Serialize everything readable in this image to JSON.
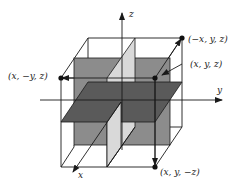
{
  "diagram": {
    "type": "3d-reflection-symmetry",
    "axes": {
      "x": "x",
      "y": "y",
      "z": "z"
    },
    "points": [
      {
        "id": "p-xyz",
        "label": "(x,  y,  z)"
      },
      {
        "id": "p-neg-x",
        "label": "(−x,  y,  z)"
      },
      {
        "id": "p-neg-y",
        "label": "(x,  −y,  z)"
      },
      {
        "id": "p-neg-z",
        "label": "(x,  y,  −z)"
      }
    ],
    "planes": [
      {
        "name": "xz-plane",
        "color": "#8c8c8c"
      },
      {
        "name": "yz-plane",
        "color": "#d9d9d9"
      },
      {
        "name": "xy-plane",
        "color": "#5a5a5a"
      }
    ],
    "colors": {
      "line": "#1a1a1a",
      "background": "#ffffff"
    }
  }
}
